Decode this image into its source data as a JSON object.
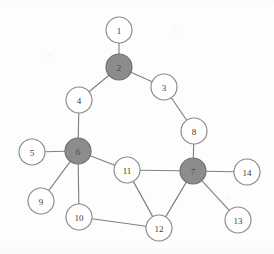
{
  "figure": {
    "type": "node-link-diagram",
    "background_color": "#fdfdfd",
    "edge_color": "#808080",
    "node_fill_plain": "#ffffff",
    "node_fill_shaded": "#8c8c8c",
    "node_stroke": "#8a8a8a",
    "label_color": "#3a3a3a",
    "node_radius": 13
  },
  "nodes": [
    {
      "id": "1",
      "label": "1",
      "x": 119,
      "y": 30,
      "r": 13,
      "shaded": false
    },
    {
      "id": "2",
      "label": "2",
      "x": 119,
      "y": 67,
      "r": 13,
      "shaded": true
    },
    {
      "id": "3",
      "label": "3",
      "x": 164,
      "y": 87,
      "r": 13,
      "shaded": false
    },
    {
      "id": "4",
      "label": "4",
      "x": 79,
      "y": 100,
      "r": 13,
      "shaded": false
    },
    {
      "id": "5",
      "label": "5",
      "x": 32,
      "y": 152,
      "r": 13,
      "shaded": false
    },
    {
      "id": "6",
      "label": "6",
      "x": 78,
      "y": 151,
      "r": 13,
      "shaded": true
    },
    {
      "id": "7",
      "label": "7",
      "x": 193,
      "y": 171,
      "r": 13,
      "shaded": true
    },
    {
      "id": "8",
      "label": "8",
      "x": 194,
      "y": 131,
      "r": 13,
      "shaded": false
    },
    {
      "id": "9",
      "label": "9",
      "x": 41,
      "y": 201,
      "r": 13,
      "shaded": false
    },
    {
      "id": "10",
      "label": "10",
      "x": 79,
      "y": 217,
      "r": 13,
      "shaded": false
    },
    {
      "id": "11",
      "label": "11",
      "x": 127,
      "y": 170,
      "r": 13,
      "shaded": false
    },
    {
      "id": "12",
      "label": "12",
      "x": 159,
      "y": 228,
      "r": 13,
      "shaded": false
    },
    {
      "id": "13",
      "label": "13",
      "x": 238,
      "y": 220,
      "r": 13,
      "shaded": false
    },
    {
      "id": "14",
      "label": "14",
      "x": 247,
      "y": 172,
      "r": 13,
      "shaded": false
    }
  ],
  "edges": [
    {
      "source": "1",
      "target": "2"
    },
    {
      "source": "2",
      "target": "3"
    },
    {
      "source": "2",
      "target": "4"
    },
    {
      "source": "3",
      "target": "8"
    },
    {
      "source": "4",
      "target": "6"
    },
    {
      "source": "5",
      "target": "6"
    },
    {
      "source": "6",
      "target": "9"
    },
    {
      "source": "6",
      "target": "10"
    },
    {
      "source": "6",
      "target": "11"
    },
    {
      "source": "8",
      "target": "7"
    },
    {
      "source": "7",
      "target": "11"
    },
    {
      "source": "7",
      "target": "12"
    },
    {
      "source": "7",
      "target": "13"
    },
    {
      "source": "7",
      "target": "14"
    },
    {
      "source": "10",
      "target": "12"
    },
    {
      "source": "11",
      "target": "12"
    }
  ]
}
